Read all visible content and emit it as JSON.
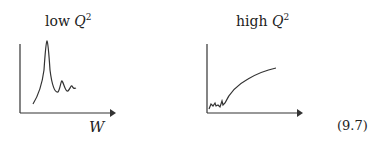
{
  "figure": {
    "left_panel": {
      "title_prefix": "low ",
      "title_var": "Q",
      "title_exp": "2",
      "x_label": "W"
    },
    "right_panel": {
      "title_prefix": "high ",
      "title_var": "Q",
      "title_exp": "2"
    },
    "equation_number": "(9.7)",
    "line_color": "#333333"
  }
}
